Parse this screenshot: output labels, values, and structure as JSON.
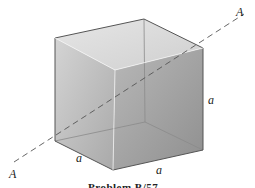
{
  "figure": {
    "axis_label_start": "A",
    "axis_label_end": "A",
    "edge_labels": [
      "a",
      "a",
      "a"
    ],
    "caption": "Problem B/57"
  },
  "colors": {
    "face_top": "#dcdcdc",
    "face_left": "#bdbdbd",
    "face_right": "#a6a6a6",
    "edge": "#555555",
    "axis_dash": "#555555"
  }
}
